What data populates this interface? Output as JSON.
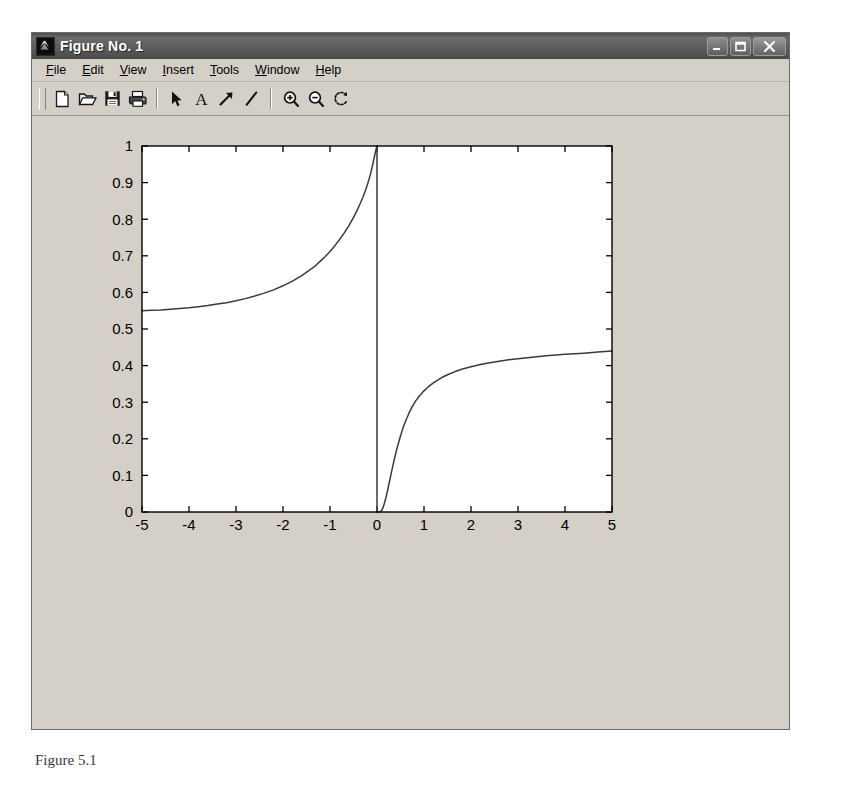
{
  "window": {
    "title": "Figure No. 1",
    "icon": "matlab-membrane-icon",
    "controls": [
      {
        "name": "minimize-button",
        "glyph": "minimize"
      },
      {
        "name": "maximize-button",
        "glyph": "maximize"
      },
      {
        "name": "close-button",
        "glyph": "close"
      }
    ]
  },
  "menubar": {
    "items": [
      {
        "label": "File",
        "mnemonic": "F",
        "rest": "ile"
      },
      {
        "label": "Edit",
        "mnemonic": "E",
        "rest": "dit"
      },
      {
        "label": "View",
        "mnemonic": "V",
        "rest": "iew"
      },
      {
        "label": "Insert",
        "mnemonic": "I",
        "rest": "nsert"
      },
      {
        "label": "Tools",
        "mnemonic": "T",
        "rest": "ools"
      },
      {
        "label": "Window",
        "mnemonic": "W",
        "rest": "indow"
      },
      {
        "label": "Help",
        "mnemonic": "H",
        "rest": "elp"
      }
    ]
  },
  "toolbar": {
    "buttons": [
      {
        "name": "new-figure-button",
        "icon": "new-document-icon",
        "tooltip": "New Figure"
      },
      {
        "name": "open-file-button",
        "icon": "open-folder-icon",
        "tooltip": "Open File"
      },
      {
        "name": "save-figure-button",
        "icon": "save-floppy-icon",
        "tooltip": "Save Figure"
      },
      {
        "name": "print-figure-button",
        "icon": "printer-icon",
        "tooltip": "Print Figure"
      },
      {
        "name": "edit-plot-button",
        "icon": "arrow-cursor-icon",
        "tooltip": "Edit Plot"
      },
      {
        "name": "insert-text-button",
        "icon": "text-a-icon",
        "tooltip": "Insert Text"
      },
      {
        "name": "insert-arrow-button",
        "icon": "arrow-annotation-icon",
        "tooltip": "Insert Arrow"
      },
      {
        "name": "insert-line-button",
        "icon": "line-annotation-icon",
        "tooltip": "Insert Line"
      },
      {
        "name": "zoom-in-button",
        "icon": "magnifier-plus-icon",
        "tooltip": "Zoom In"
      },
      {
        "name": "zoom-out-button",
        "icon": "magnifier-minus-icon",
        "tooltip": "Zoom Out"
      },
      {
        "name": "rotate-3d-button",
        "icon": "rotate-3d-icon",
        "tooltip": "Rotate 3D"
      }
    ]
  },
  "caption": "Figure 5.1",
  "colors": {
    "window_face": "#d4d0c8",
    "titlebar": "#5d5d5d",
    "axes_background": "#ffffff",
    "axes_line": "#000000",
    "curve": "#3a3a3a",
    "tick_label": "#000000"
  },
  "chart_data": {
    "type": "line",
    "title": "",
    "xlabel": "",
    "ylabel": "",
    "xlim": [
      -5,
      5
    ],
    "ylim": [
      0,
      1
    ],
    "xticks": [
      -5,
      -4,
      -3,
      -2,
      -1,
      0,
      1,
      2,
      3,
      4,
      5
    ],
    "xtick_labels": [
      "-5",
      "-4",
      "-3",
      "-2",
      "-1",
      "0",
      "1",
      "2",
      "3",
      "4",
      "5"
    ],
    "yticks": [
      0,
      0.1,
      0.2,
      0.3,
      0.4,
      0.5,
      0.6,
      0.7,
      0.8,
      0.9,
      1
    ],
    "ytick_labels": [
      "0",
      "0.1",
      "0.2",
      "0.3",
      "0.4",
      "0.5",
      "0.6",
      "0.7",
      "0.8",
      "0.9",
      "1"
    ],
    "grid": false,
    "legend": null,
    "box": true,
    "tick_direction": "in",
    "discontinuity_at_x": 0,
    "series": [
      {
        "name": "left-branch",
        "comment": "rises from 0.55 at x=-5 to 1.0 at x=0-",
        "points": [
          [
            -5.0,
            0.55
          ],
          [
            -4.8,
            0.551
          ],
          [
            -4.6,
            0.552
          ],
          [
            -4.4,
            0.554
          ],
          [
            -4.2,
            0.556
          ],
          [
            -4.0,
            0.558
          ],
          [
            -3.8,
            0.561
          ],
          [
            -3.6,
            0.564
          ],
          [
            -3.4,
            0.568
          ],
          [
            -3.2,
            0.572
          ],
          [
            -3.0,
            0.577
          ],
          [
            -2.8,
            0.583
          ],
          [
            -2.6,
            0.59
          ],
          [
            -2.4,
            0.598
          ],
          [
            -2.2,
            0.607
          ],
          [
            -2.0,
            0.618
          ],
          [
            -1.8,
            0.631
          ],
          [
            -1.6,
            0.646
          ],
          [
            -1.4,
            0.664
          ],
          [
            -1.3,
            0.674
          ],
          [
            -1.2,
            0.686
          ],
          [
            -1.1,
            0.698
          ],
          [
            -1.0,
            0.712
          ],
          [
            -0.9,
            0.727
          ],
          [
            -0.8,
            0.744
          ],
          [
            -0.7,
            0.762
          ],
          [
            -0.6,
            0.782
          ],
          [
            -0.5,
            0.805
          ],
          [
            -0.42,
            0.825
          ],
          [
            -0.35,
            0.845
          ],
          [
            -0.3,
            0.86
          ],
          [
            -0.25,
            0.877
          ],
          [
            -0.2,
            0.896
          ],
          [
            -0.16,
            0.913
          ],
          [
            -0.13,
            0.928
          ],
          [
            -0.1,
            0.944
          ],
          [
            -0.07,
            0.962
          ],
          [
            -0.05,
            0.974
          ],
          [
            -0.03,
            0.986
          ],
          [
            -0.015,
            0.994
          ],
          [
            0.0,
            1.0
          ]
        ]
      },
      {
        "name": "vertical-drop",
        "comment": "discontinuous jump at x=0 from 1.0 down to 0",
        "points": [
          [
            0.0,
            1.0
          ],
          [
            0.0,
            0.0
          ]
        ]
      },
      {
        "name": "right-branch",
        "comment": "rises from 0 near x=0.1 asymptotically toward 0.44 at x=5",
        "points": [
          [
            0.0,
            0.0
          ],
          [
            0.06,
            0.0
          ],
          [
            0.1,
            0.004
          ],
          [
            0.14,
            0.016
          ],
          [
            0.18,
            0.034
          ],
          [
            0.22,
            0.056
          ],
          [
            0.26,
            0.08
          ],
          [
            0.3,
            0.104
          ],
          [
            0.34,
            0.128
          ],
          [
            0.38,
            0.15
          ],
          [
            0.42,
            0.171
          ],
          [
            0.46,
            0.19
          ],
          [
            0.5,
            0.208
          ],
          [
            0.56,
            0.232
          ],
          [
            0.62,
            0.252
          ],
          [
            0.68,
            0.27
          ],
          [
            0.75,
            0.288
          ],
          [
            0.82,
            0.303
          ],
          [
            0.9,
            0.317
          ],
          [
            1.0,
            0.331
          ],
          [
            1.1,
            0.343
          ],
          [
            1.2,
            0.353
          ],
          [
            1.3,
            0.361
          ],
          [
            1.4,
            0.369
          ],
          [
            1.5,
            0.375
          ],
          [
            1.65,
            0.383
          ],
          [
            1.8,
            0.39
          ],
          [
            2.0,
            0.397
          ],
          [
            2.2,
            0.403
          ],
          [
            2.4,
            0.408
          ],
          [
            2.6,
            0.412
          ],
          [
            2.8,
            0.416
          ],
          [
            3.0,
            0.419
          ],
          [
            3.3,
            0.423
          ],
          [
            3.6,
            0.427
          ],
          [
            4.0,
            0.431
          ],
          [
            4.4,
            0.434
          ],
          [
            4.7,
            0.437
          ],
          [
            5.0,
            0.44
          ]
        ]
      }
    ]
  }
}
